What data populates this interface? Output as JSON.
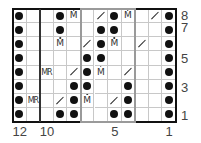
{
  "chart_title": "Knitting stitch chart",
  "grid": {
    "columns": 12,
    "rows": 8,
    "row_order_top_to_bottom": [
      8,
      7,
      6,
      5,
      4,
      3,
      2,
      1
    ],
    "column_order_left_to_right": [
      12,
      11,
      10,
      9,
      8,
      7,
      6,
      5,
      4,
      3,
      2,
      1
    ]
  },
  "symbols": {
    "dot": "purl",
    "slash": "k2tog-right-slant",
    "M": "make-one",
    "MR": "make-one-right",
    "blank": "knit"
  },
  "cells": [
    [
      "dot",
      "",
      "",
      "dot",
      "M",
      "",
      "slash",
      "dot",
      "M",
      "",
      "slash",
      "dot"
    ],
    [
      "dot",
      "",
      "",
      "dot",
      "",
      "",
      "dot",
      "dot",
      "",
      "",
      "",
      "dot"
    ],
    [
      "dot",
      "",
      "",
      "M",
      "",
      "slash",
      "dot",
      "M",
      "",
      "slash",
      "",
      "dot"
    ],
    [
      "dot",
      "",
      "",
      "",
      "",
      "dot",
      "dot",
      "",
      "",
      "",
      "",
      "dot"
    ],
    [
      "dot",
      "",
      "MR",
      "",
      "slash",
      "dot",
      "M",
      "",
      "slash",
      "",
      "",
      "dot"
    ],
    [
      "dot",
      "",
      "",
      "",
      "dot",
      "dot",
      "",
      "",
      "dot",
      "",
      "",
      "dot"
    ],
    [
      "dot",
      "MR",
      "",
      "slash",
      "dot",
      "M",
      "",
      "slash",
      "dot",
      "",
      "",
      "dot"
    ],
    [
      "dot",
      "",
      "",
      "dot",
      "dot",
      "",
      "",
      "dot",
      "dot",
      "",
      "",
      "dot"
    ]
  ],
  "row_labels": [
    {
      "text": "8",
      "row": 8
    },
    {
      "text": "7",
      "row": 7
    },
    {
      "text": "5",
      "row": 5
    },
    {
      "text": "3",
      "row": 3
    },
    {
      "text": "1",
      "row": 1
    }
  ],
  "column_labels": [
    {
      "text": "12",
      "col": 12
    },
    {
      "text": "10",
      "col": 10
    },
    {
      "text": "5",
      "col": 5
    },
    {
      "text": "1",
      "col": 1
    }
  ],
  "text_glyphs": {
    "M": "M",
    "MR": "MR"
  },
  "colors": {
    "dot": "#111111",
    "outer_frame": "#111111",
    "repeat_frame": "#9a9a9a",
    "grid_line": "#c8c8c8"
  }
}
